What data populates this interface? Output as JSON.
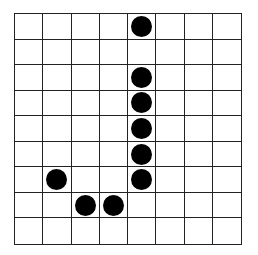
{
  "grid": {
    "columns": 8,
    "rows": 9,
    "line_color": "#222222",
    "dot_color": "#000000",
    "dots": [
      {
        "row": 0,
        "col": 4
      },
      {
        "row": 2,
        "col": 4
      },
      {
        "row": 3,
        "col": 4
      },
      {
        "row": 4,
        "col": 4
      },
      {
        "row": 5,
        "col": 4
      },
      {
        "row": 6,
        "col": 4
      },
      {
        "row": 6,
        "col": 1
      },
      {
        "row": 7,
        "col": 2
      },
      {
        "row": 7,
        "col": 3
      }
    ]
  }
}
